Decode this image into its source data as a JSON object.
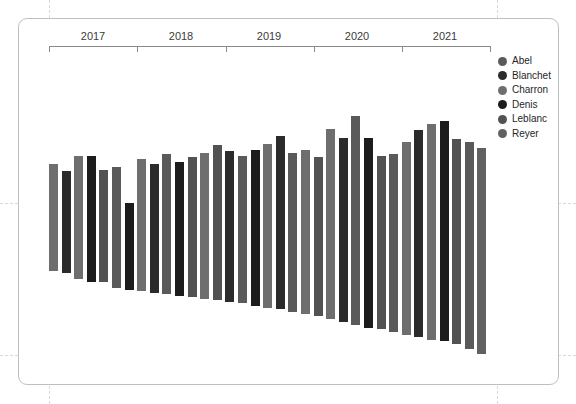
{
  "chart_data": {
    "type": "bar",
    "title": "",
    "subtitle": "",
    "xlabel": "",
    "ylabel": "",
    "orientation": "vertical",
    "stacked_diverging": true,
    "grid": {
      "horizontal_dashed": true,
      "vertical_dashed": true,
      "show": true
    },
    "axis": {
      "x_type": "time",
      "x_tick_labels": [
        "2017",
        "2018",
        "2019",
        "2020",
        "2021"
      ],
      "x_range": [
        "2016-10",
        "2021-12"
      ],
      "y_range": [
        -100,
        60
      ],
      "zero_line": 0,
      "y_tick_labels": []
    },
    "legend": {
      "position": "right",
      "entries": [
        {
          "name": "Abel",
          "color": "#5a5a5a"
        },
        {
          "name": "Blanchet",
          "color": "#2b2b2b"
        },
        {
          "name": "Charron",
          "color": "#6e6e6e"
        },
        {
          "name": "Denis",
          "color": "#1c1c1c"
        },
        {
          "name": "Leblanc",
          "color": "#525252"
        },
        {
          "name": "Reyer",
          "color": "#616161"
        }
      ]
    },
    "points": [
      {
        "label": "2016-11",
        "series": "Charron",
        "color": "#6e6e6e",
        "positive": 26,
        "negative": -45
      },
      {
        "label": "2016-12",
        "series": "Blanchet",
        "color": "#2b2b2b",
        "positive": 21,
        "negative": -46
      },
      {
        "label": "2017-01",
        "series": "Charron",
        "color": "#6e6e6e",
        "positive": 31,
        "negative": -50
      },
      {
        "label": "2017-02",
        "series": "Denis",
        "color": "#1c1c1c",
        "positive": 31,
        "negative": -52
      },
      {
        "label": "2017-03",
        "series": "Leblanc",
        "color": "#525252",
        "positive": 22,
        "negative": -52
      },
      {
        "label": "2017-04",
        "series": "Abel",
        "color": "#5a5a5a",
        "positive": 24,
        "negative": -56
      },
      {
        "label": "2017-05",
        "series": "Denis",
        "color": "#1c1c1c",
        "positive": 0,
        "negative": -57
      },
      {
        "label": "2017-06",
        "series": "Charron",
        "color": "#6e6e6e",
        "positive": 29,
        "negative": -58
      },
      {
        "label": "2017-07",
        "series": "Blanchet",
        "color": "#2b2b2b",
        "positive": 26,
        "negative": -59
      },
      {
        "label": "2017-08",
        "series": "Abel",
        "color": "#5a5a5a",
        "positive": 32,
        "negative": -60
      },
      {
        "label": "2017-09",
        "series": "Denis",
        "color": "#1c1c1c",
        "positive": 27,
        "negative": -61
      },
      {
        "label": "2017-10",
        "series": "Leblanc",
        "color": "#525252",
        "positive": 30,
        "negative": -62
      },
      {
        "label": "2017-11",
        "series": "Charron",
        "color": "#6e6e6e",
        "positive": 33,
        "negative": -63
      },
      {
        "label": "2018-01",
        "series": "Leblanc",
        "color": "#525252",
        "positive": 38,
        "negative": -64
      },
      {
        "label": "2018-02",
        "series": "Blanchet",
        "color": "#2b2b2b",
        "positive": 34,
        "negative": -65
      },
      {
        "label": "2018-03",
        "series": "Abel",
        "color": "#5a5a5a",
        "positive": 31,
        "negative": -66
      },
      {
        "label": "2018-04",
        "series": "Denis",
        "color": "#1c1c1c",
        "positive": 35,
        "negative": -68
      },
      {
        "label": "2018-05",
        "series": "Charron",
        "color": "#6e6e6e",
        "positive": 39,
        "negative": -69
      },
      {
        "label": "2018-06",
        "series": "Blanchet",
        "color": "#2b2b2b",
        "positive": 44,
        "negative": -70
      },
      {
        "label": "2018-07",
        "series": "Abel",
        "color": "#5a5a5a",
        "positive": 33,
        "negative": -72
      },
      {
        "label": "2018-08",
        "series": "Charron",
        "color": "#6e6e6e",
        "positive": 35,
        "negative": -73
      },
      {
        "label": "2018-09",
        "series": "Leblanc",
        "color": "#525252",
        "positive": 30,
        "negative": -74
      },
      {
        "label": "2019-01",
        "series": "Charron",
        "color": "#6e6e6e",
        "positive": 49,
        "negative": -76
      },
      {
        "label": "2019-02",
        "series": "Blanchet",
        "color": "#2b2b2b",
        "positive": 43,
        "negative": -78
      },
      {
        "label": "2019-03",
        "series": "Abel",
        "color": "#5a5a5a",
        "positive": 57,
        "negative": -80
      },
      {
        "label": "2019-04",
        "series": "Denis",
        "color": "#1c1c1c",
        "positive": 43,
        "negative": -82
      },
      {
        "label": "2019-05",
        "series": "Leblanc",
        "color": "#525252",
        "positive": 31,
        "negative": -83
      },
      {
        "label": "2019-06",
        "series": "Abel",
        "color": "#5a5a5a",
        "positive": 32,
        "negative": -85
      },
      {
        "label": "2020-01",
        "series": "Charron",
        "color": "#6e6e6e",
        "positive": 40,
        "negative": -87
      },
      {
        "label": "2020-02",
        "series": "Blanchet",
        "color": "#2b2b2b",
        "positive": 48,
        "negative": -88
      },
      {
        "label": "2020-03",
        "series": "Charron",
        "color": "#6e6e6e",
        "positive": 52,
        "negative": -90
      },
      {
        "label": "2020-04",
        "series": "Denis",
        "color": "#1c1c1c",
        "positive": 54,
        "negative": -91
      },
      {
        "label": "2020-05",
        "series": "Leblanc",
        "color": "#525252",
        "positive": 42,
        "negative": -93
      },
      {
        "label": "2021-01",
        "series": "Abel",
        "color": "#5a5a5a",
        "positive": 40,
        "negative": -96
      },
      {
        "label": "2021-02",
        "series": "Reyer",
        "color": "#616161",
        "positive": 36,
        "negative": -99
      }
    ]
  },
  "legend": {
    "items": [
      {
        "label": "Abel",
        "color": "#5a5a5a"
      },
      {
        "label": "Blanchet",
        "color": "#2b2b2b"
      },
      {
        "label": "Charron",
        "color": "#6e6e6e"
      },
      {
        "label": "Denis",
        "color": "#1c1c1c"
      },
      {
        "label": "Leblanc",
        "color": "#525252"
      },
      {
        "label": "Reyer",
        "color": "#616161"
      }
    ]
  },
  "axis": {
    "years": [
      "2017",
      "2018",
      "2019",
      "2020",
      "2021"
    ]
  }
}
